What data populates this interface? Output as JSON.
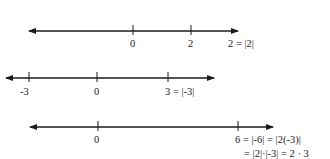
{
  "lines": [
    {
      "name": "number-line-1",
      "ticks": [
        {
          "value": "0",
          "label": "0"
        },
        {
          "value": "2",
          "label": "2"
        }
      ],
      "annotation": "2 = |2|"
    },
    {
      "name": "number-line-2",
      "ticks": [
        {
          "value": "-3",
          "label": "-3"
        },
        {
          "value": "0",
          "label": "0"
        },
        {
          "value": "3",
          "label": "3 = |-3|"
        }
      ]
    },
    {
      "name": "number-line-3",
      "ticks": [
        {
          "value": "0",
          "label": "0"
        },
        {
          "value": "6",
          "label": "6 = |-6| = |2(-3)|"
        }
      ],
      "annotation_line2": "= |2|·|-3| = 2 · 3"
    }
  ]
}
